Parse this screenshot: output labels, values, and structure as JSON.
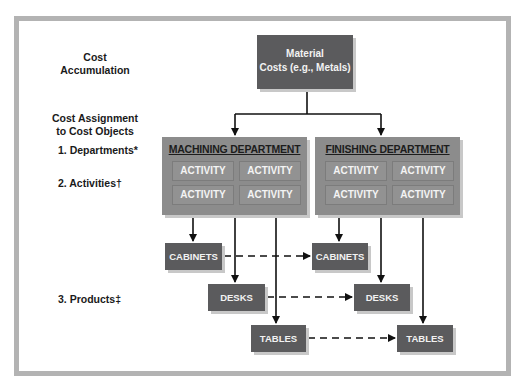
{
  "labels": {
    "cost_accumulation_1": "Cost",
    "cost_accumulation_2": "Accumulation",
    "cost_assignment_1": "Cost Assignment",
    "cost_assignment_2": "to Cost Objects",
    "departments": "1.  Departments*",
    "activities": "2.  Activities†",
    "products": "3.  Products‡"
  },
  "material": {
    "line1": "Material",
    "line2": "Costs (e.g., Metals)"
  },
  "departments": [
    {
      "title": "MACHINING DEPARTMENT",
      "activities": [
        "ACTIVITY",
        "ACTIVITY",
        "ACTIVITY",
        "ACTIVITY"
      ],
      "products": [
        "CABINETS",
        "DESKS",
        "TABLES"
      ]
    },
    {
      "title": "FINISHING DEPARTMENT",
      "activities": [
        "ACTIVITY",
        "ACTIVITY",
        "ACTIVITY",
        "ACTIVITY"
      ],
      "products": [
        "CABINETS",
        "DESKS",
        "TABLES"
      ]
    }
  ],
  "colors": {
    "material_box": "#5b5b5d",
    "department_box": "#8c8c8c",
    "product_box": "#5b5b5d",
    "frame": "#b3b3b3"
  }
}
